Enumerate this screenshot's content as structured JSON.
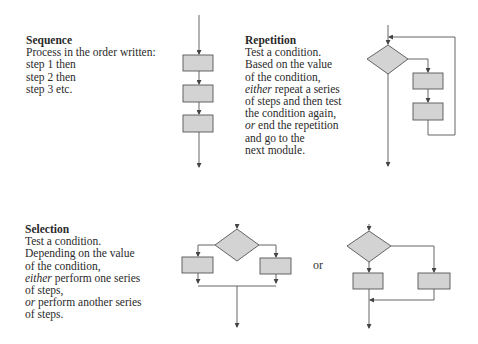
{
  "sequence": {
    "title": "Sequence",
    "lines": [
      "Process in the order written:",
      "step 1 then",
      "step 2 then",
      "step 3 etc."
    ]
  },
  "repetition": {
    "title": "Repetition",
    "lines": [
      {
        "text": "Test a condition."
      },
      {
        "text": "Based on the value"
      },
      {
        "text": "of the condition,"
      },
      {
        "em": "either",
        "text": " repeat a series"
      },
      {
        "text": "of steps and then test"
      },
      {
        "text": "the condition again,"
      },
      {
        "em": "or",
        "text": " end the repetition"
      },
      {
        "text": "and go to the"
      },
      {
        "text": "next module."
      }
    ]
  },
  "selection": {
    "title": "Selection",
    "lines": [
      {
        "text": "Test a condition."
      },
      {
        "text": "Depending on the value"
      },
      {
        "text": "of the condition,"
      },
      {
        "em": "either",
        "text": " perform one series"
      },
      {
        "text": "of steps,"
      },
      {
        "em": "or",
        "text": " perform another series"
      },
      {
        "text": "of steps."
      }
    ]
  },
  "or_label": "or",
  "colors": {
    "box_fill": "#d3d3d3",
    "stroke": "#555555",
    "text": "#2a2a2a"
  }
}
